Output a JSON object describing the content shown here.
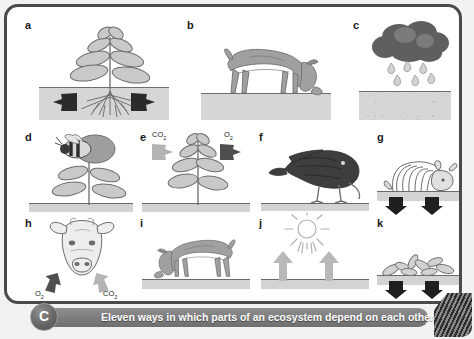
{
  "figure": {
    "caption": {
      "badge": "C",
      "text": "Eleven ways in which parts of an ecosystem depend on each other"
    },
    "colors": {
      "frame": "#4a4a4a",
      "ground": "#d6d6d6",
      "dark_arrow": "#2b2b2b",
      "light_arrow": "#a8a8a8",
      "caption_bar": "#7d7d7d",
      "cloud": "#5f5f5f",
      "plant_leaf": "#c9c9c9",
      "animal": "#9c9c9c"
    },
    "panels": [
      {
        "id": "a",
        "label": "a",
        "subject": "plant-with-roots-in-soil",
        "icon": "plant-roots-icon",
        "arrows": "two-dark-arrows-in-soil",
        "gases": []
      },
      {
        "id": "b",
        "label": "b",
        "subject": "cow-grazing",
        "icon": "grazing-cow-icon",
        "arrows": "",
        "gases": []
      },
      {
        "id": "c",
        "label": "c",
        "subject": "rain-cloud-over-ground",
        "icon": "rain-cloud-icon",
        "arrows": "",
        "gases": []
      },
      {
        "id": "d",
        "label": "d",
        "subject": "bee-pollinating-flower",
        "icon": "bee-on-flower-icon",
        "arrows": "",
        "gases": []
      },
      {
        "id": "e",
        "label": "e",
        "subject": "plant-gas-exchange",
        "icon": "plant-icon",
        "arrows": "co2-in-o2-out",
        "gases": [
          {
            "name": "CO",
            "sub": "2",
            "position": "left",
            "tone": "light"
          },
          {
            "name": "O",
            "sub": "2",
            "position": "right",
            "tone": "dark"
          }
        ]
      },
      {
        "id": "f",
        "label": "f",
        "subject": "bird-feeding-on-ground",
        "icon": "bird-pecking-icon",
        "arrows": "",
        "gases": []
      },
      {
        "id": "g",
        "label": "g",
        "subject": "animal-carcass-decomposing",
        "icon": "skeleton-carcass-icon",
        "arrows": "two-dark-down-arrows",
        "gases": []
      },
      {
        "id": "h",
        "label": "h",
        "subject": "cow-breathing",
        "icon": "cow-head-icon",
        "arrows": "o2-in-co2-out",
        "gases": [
          {
            "name": "O",
            "sub": "2",
            "position": "left",
            "tone": "dark"
          },
          {
            "name": "CO",
            "sub": "2",
            "position": "right",
            "tone": "light"
          }
        ]
      },
      {
        "id": "i",
        "label": "i",
        "subject": "cow-grazing-facing-left",
        "icon": "grazing-cow-icon",
        "arrows": "",
        "gases": []
      },
      {
        "id": "j",
        "label": "j",
        "subject": "sunlight-and-evaporation",
        "icon": "sun-icon",
        "arrows": "two-light-up-arrows",
        "gases": []
      },
      {
        "id": "k",
        "label": "k",
        "subject": "leaf-litter-decomposing",
        "icon": "fallen-leaves-icon",
        "arrows": "two-dark-down-arrows",
        "gases": []
      }
    ]
  }
}
